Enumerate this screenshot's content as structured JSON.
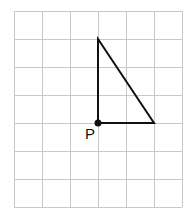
{
  "diagram": {
    "type": "grid-with-triangle",
    "grid": {
      "columns": 6,
      "rows": 7,
      "origin_x": 14,
      "origin_y": 11,
      "cell_size": 28,
      "line_color": "#c8c8c8"
    },
    "triangle": {
      "vertices_grid": [
        [
          3,
          1
        ],
        [
          3,
          4
        ],
        [
          5,
          4
        ]
      ],
      "stroke_color": "#111111"
    },
    "point": {
      "label": "P",
      "grid": [
        3,
        4
      ],
      "color": "#111111"
    }
  }
}
